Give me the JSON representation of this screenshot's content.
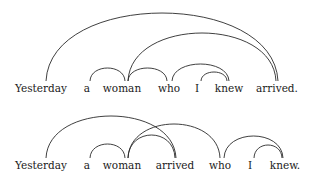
{
  "figure": {
    "line_color": "#2a2a2a",
    "text_color": "#1a1a1a",
    "sentences": [
      {
        "id": "sentence-1",
        "words": [
          {
            "text": "Yesterday",
            "x": 41,
            "y": 83
          },
          {
            "text": "a",
            "x": 87,
            "y": 83
          },
          {
            "text": "woman",
            "x": 122,
            "y": 83
          },
          {
            "text": "who",
            "x": 169,
            "y": 83
          },
          {
            "text": "I",
            "x": 197,
            "y": 83
          },
          {
            "text": "knew",
            "x": 229,
            "y": 83
          },
          {
            "text": "arrived.",
            "x": 277,
            "y": 83
          }
        ],
        "arcs": [
          {
            "from": "Yesterday",
            "to": "arrived.",
            "x1": 46,
            "x2": 278,
            "peak": 13
          },
          {
            "from": "woman",
            "to": "arrived.",
            "x1": 128,
            "x2": 276,
            "peak": 33
          },
          {
            "from": "a",
            "to": "woman",
            "x1": 90,
            "x2": 125,
            "peak": 68
          },
          {
            "from": "woman",
            "to": "who",
            "x1": 128,
            "x2": 167,
            "peak": 68
          },
          {
            "from": "who",
            "to": "knew",
            "x1": 172,
            "x2": 229,
            "peak": 64
          },
          {
            "from": "I",
            "to": "knew",
            "x1": 201,
            "x2": 227,
            "peak": 72
          }
        ]
      },
      {
        "id": "sentence-2",
        "words": [
          {
            "text": "Yesterday",
            "x": 41,
            "y": 160
          },
          {
            "text": "a",
            "x": 87,
            "y": 160
          },
          {
            "text": "woman",
            "x": 122,
            "y": 160
          },
          {
            "text": "arrived",
            "x": 175,
            "y": 160
          },
          {
            "text": "who",
            "x": 220,
            "y": 160
          },
          {
            "text": "I",
            "x": 250,
            "y": 160
          },
          {
            "text": "knew.",
            "x": 285,
            "y": 160
          }
        ],
        "arcs": [
          {
            "from": "Yesterday",
            "to": "arrived",
            "x1": 46,
            "x2": 176,
            "peak": 116
          },
          {
            "from": "a",
            "to": "woman",
            "x1": 90,
            "x2": 125,
            "peak": 144
          },
          {
            "from": "woman",
            "to": "arrived",
            "x1": 128,
            "x2": 175,
            "peak": 135
          },
          {
            "from": "woman",
            "to": "who",
            "x1": 128,
            "x2": 220,
            "peak": 124
          },
          {
            "from": "who",
            "to": "knew.",
            "x1": 224,
            "x2": 283,
            "peak": 136
          },
          {
            "from": "I",
            "to": "knew.",
            "x1": 254,
            "x2": 282,
            "peak": 145
          }
        ]
      }
    ]
  }
}
